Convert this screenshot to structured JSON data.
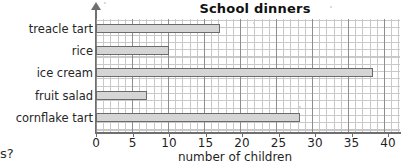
{
  "chart_data": {
    "type": "bar",
    "orientation": "horizontal",
    "title": "School dinners",
    "xlabel": "number of children",
    "ylabel": "",
    "categories": [
      "treacle tart",
      "rice",
      "ice cream",
      "fruit salad",
      "cornflake tart"
    ],
    "values": [
      17,
      10,
      38,
      7,
      28
    ],
    "xlim": [
      0,
      42
    ],
    "xticks": [
      0,
      5,
      10,
      15,
      20,
      25,
      30,
      35,
      40
    ],
    "xtick_labels": [
      "0",
      "5",
      "10",
      "15",
      "20",
      "25",
      "30",
      "35",
      "40"
    ],
    "grid": true,
    "grid_minor_step": 1,
    "grid_major_step": 5,
    "legend": "none",
    "bar_fill_color": "#d5d5d5",
    "bar_edge_color": "#6b6b6b",
    "grid_minor_color": "#c9c9c9",
    "grid_major_color": "#8e8e8e",
    "axis_color": "#6f6f6f"
  },
  "page": {
    "fragment_text": "s?"
  }
}
